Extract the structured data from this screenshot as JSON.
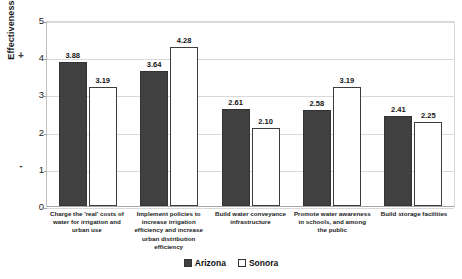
{
  "chart_data": {
    "type": "bar",
    "title": "",
    "xlabel": "",
    "ylabel": "Effectiveness",
    "ylim": [
      0,
      5
    ],
    "yticks": [
      "0",
      "1",
      "2",
      "3",
      "4",
      "5"
    ],
    "grid": true,
    "legend_position": "bottom-center",
    "categories": [
      "Charge the 'real' costs of water for irrigation and urban use",
      "Implement policies to increase irrigation efficiency and increase urban distribution efficiency",
      "Build water conveyance infrastructure",
      "Promote water awareness in schools, and among the public",
      "Build storage facilities"
    ],
    "series": [
      {
        "name": "Arizona",
        "color": "#404040",
        "values": [
          3.88,
          3.64,
          2.61,
          2.58,
          2.41
        ]
      },
      {
        "name": "Sonora",
        "color": "#ffffff",
        "values": [
          3.19,
          4.28,
          2.1,
          3.19,
          2.25
        ]
      }
    ],
    "value_labels": {
      "arizona": [
        "3.88",
        "3.64",
        "2.61",
        "2.58",
        "2.41"
      ],
      "sonora": [
        "3.19",
        "4.28",
        "2.10",
        "3.19",
        "2.25"
      ]
    },
    "polarity_markers": {
      "positive": "+",
      "negative": "-"
    }
  }
}
